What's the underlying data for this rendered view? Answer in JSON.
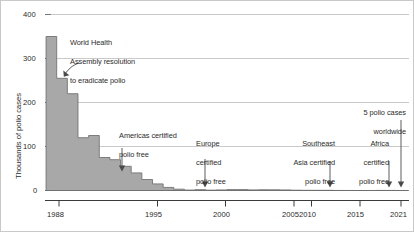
{
  "chart_data": {
    "type": "area",
    "title": "",
    "xlabel": "",
    "ylabel": "Thousands of polio cases",
    "ylim": [
      0,
      400
    ],
    "xlim": [
      1987.4,
      2021.6
    ],
    "grid": "horizontal",
    "legend": "none",
    "y_ticks": [
      0,
      100,
      200,
      300,
      400
    ],
    "y_tick_labels": [
      "0",
      "100",
      "200",
      "300",
      "400"
    ],
    "x_ticks": [
      1988,
      1995,
      2000,
      2005,
      2010,
      2015,
      2021
    ],
    "x_tick_labels": [
      "1988",
      "1995",
      "2000",
      "2005",
      "2010",
      "2015",
      "2021"
    ],
    "x": [
      1988,
      1989,
      1990,
      1991,
      1992,
      1993,
      1994,
      1995,
      1996,
      1997,
      1998,
      1999,
      2000,
      2001,
      2002,
      2003,
      2004,
      2005,
      2006,
      2007,
      2008,
      2009,
      2010,
      2011,
      2012,
      2013,
      2014,
      2015,
      2016,
      2017,
      2018,
      2019,
      2020,
      2021
    ],
    "values": [
      350,
      255,
      220,
      120,
      125,
      75,
      70,
      55,
      40,
      25,
      15,
      7,
      3,
      1.0,
      1.9,
      0.8,
      1.3,
      2.0,
      2.0,
      1.4,
      1.7,
      1.6,
      1.3,
      0.7,
      0.4,
      0.4,
      0.4,
      0.1,
      0.04,
      0.03,
      0.03,
      0.18,
      0.14,
      0.005
    ],
    "series": [
      {
        "name": "Reported polio cases (thousands)",
        "color": "#a8a8a8"
      }
    ],
    "annotations": [
      {
        "id": "wha-resolution",
        "text": "World Health\nAssembly resolution\nto eradicate polio",
        "x": 1988,
        "arrow": "curved-down-left"
      },
      {
        "id": "americas-certified",
        "text": "Americas certified\npolio free",
        "x": 1994,
        "arrow": "down"
      },
      {
        "id": "europe-certified",
        "text": "Europe\ncertified\npolio free",
        "x": 2002,
        "arrow": "down"
      },
      {
        "id": "southeast-asia-certified",
        "text": "Southeast\nAsia certified\npolio free",
        "x": 2014,
        "arrow": "down"
      },
      {
        "id": "africa-certified",
        "text": "Africa\ncertified\npolio free",
        "x": 2019,
        "arrow": "down"
      },
      {
        "id": "five-cases-worldwide",
        "text": "5 polio cases\nworldwide",
        "x": 2021,
        "arrow": "down"
      }
    ]
  },
  "axis": {
    "y_label": "Thousands of polio cases",
    "y_ticks": [
      {
        "label": "400"
      },
      {
        "label": "300"
      },
      {
        "label": "200"
      },
      {
        "label": "100"
      },
      {
        "label": "0"
      }
    ],
    "x_ticks": [
      {
        "label": "1988"
      },
      {
        "label": "1995"
      },
      {
        "label": "2000"
      },
      {
        "label": "2005"
      },
      {
        "label": "2010"
      },
      {
        "label": "2015"
      },
      {
        "label": "2021"
      }
    ]
  },
  "annotations": {
    "wha": {
      "line1": "World Health",
      "line2": "Assembly resolution",
      "line3": "to eradicate polio"
    },
    "americas": {
      "line1": "Americas certified",
      "line2": "polio free"
    },
    "europe": {
      "line1": "Europe",
      "line2": "certified",
      "line3": "polio free"
    },
    "southeast_asia": {
      "line1": "Southeast",
      "line2": "Asia certified",
      "line3": "polio free"
    },
    "africa": {
      "line1": "Africa",
      "line2": "certified",
      "line3": "polio free"
    },
    "five_cases": {
      "line1": "5 polio cases",
      "line2": "worldwide"
    }
  },
  "colors": {
    "area_fill": "#a8a8a8",
    "area_stroke": "#6e6e6e",
    "gridline": "#bdbdbd",
    "axis": "#3a3a3a",
    "text": "#2b2b2b",
    "panel_border": "#c9c9c9",
    "background": "#ffffff"
  }
}
